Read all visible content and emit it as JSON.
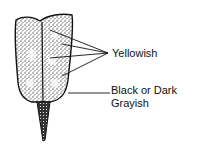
{
  "diagram": {
    "labels": [
      {
        "id": "yellowish",
        "text": "Yellowish",
        "x": 111,
        "y": 47
      },
      {
        "id": "dark",
        "lines": [
          "Black or Dark",
          "Grayish"
        ],
        "x": 110,
        "y": 81
      }
    ],
    "colors": {
      "ink": "#111111",
      "stipple": "#555555",
      "background": "#ffffff"
    }
  }
}
